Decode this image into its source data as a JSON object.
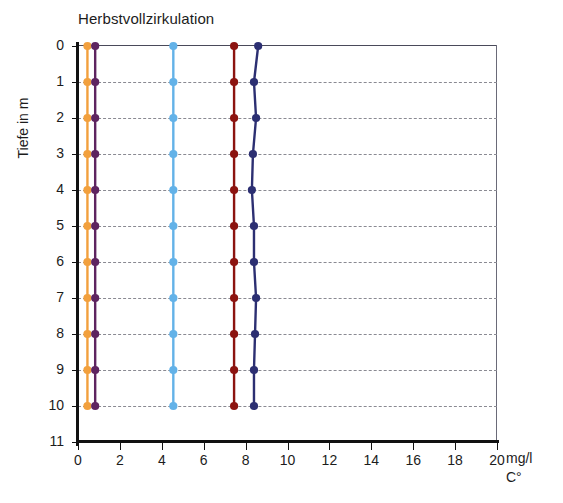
{
  "chart_data": {
    "type": "line",
    "title": "Herbstvollzirkulation",
    "orientation": "vertical-depth-profile",
    "xlabel": "",
    "ylabel": "Tiefe in m",
    "units": [
      "mg/l",
      "C°"
    ],
    "xlim": [
      0,
      20
    ],
    "ylim": [
      0,
      11
    ],
    "y_inverted": true,
    "grid": "horizontal-dashed",
    "legend": "none",
    "xticks": [
      0,
      2,
      4,
      6,
      8,
      10,
      12,
      14,
      16,
      18,
      20
    ],
    "yticks": [
      0,
      1,
      2,
      3,
      4,
      5,
      6,
      7,
      8,
      9,
      10,
      11
    ],
    "depths": [
      0,
      1,
      2,
      3,
      4,
      5,
      6,
      7,
      8,
      9,
      10
    ],
    "series": [
      {
        "name": "orange-series",
        "color": "#F2A03D",
        "values": [
          0.45,
          0.45,
          0.45,
          0.45,
          0.45,
          0.45,
          0.45,
          0.45,
          0.45,
          0.45,
          0.45
        ]
      },
      {
        "name": "purple-series",
        "color": "#5E2460",
        "values": [
          0.82,
          0.82,
          0.82,
          0.82,
          0.82,
          0.82,
          0.82,
          0.82,
          0.82,
          0.82,
          0.82
        ]
      },
      {
        "name": "light-blue-series",
        "color": "#63B2E8",
        "values": [
          4.55,
          4.55,
          4.55,
          4.55,
          4.55,
          4.55,
          4.55,
          4.55,
          4.55,
          4.55,
          4.55
        ]
      },
      {
        "name": "dark-red-series",
        "color": "#8C1410",
        "values": [
          7.45,
          7.45,
          7.45,
          7.45,
          7.45,
          7.45,
          7.45,
          7.45,
          7.45,
          7.45,
          7.45
        ]
      },
      {
        "name": "dark-blue-series",
        "color": "#2C2F72",
        "values": [
          8.6,
          8.4,
          8.5,
          8.35,
          8.3,
          8.4,
          8.4,
          8.5,
          8.45,
          8.4,
          8.4
        ]
      }
    ]
  },
  "axes": {
    "y_label": "Tiefe in m",
    "y_tick_labels": [
      "0",
      "1",
      "2",
      "3",
      "4",
      "5",
      "6",
      "7",
      "8",
      "9",
      "10",
      "11"
    ],
    "x_tick_labels": [
      "0",
      "2",
      "4",
      "6",
      "8",
      "10",
      "12",
      "14",
      "16",
      "18",
      "20"
    ],
    "unit_line_1": "mg/l",
    "unit_line_2": "C°"
  },
  "title": "Herbstvollzirkulation"
}
